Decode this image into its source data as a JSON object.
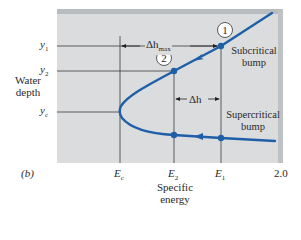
{
  "figure": {
    "panel_label": "(b)",
    "y_axis_title_line1": "Water",
    "y_axis_title_line2": "depth",
    "x_axis_title_line1": "Specific",
    "x_axis_title_line2": "energy",
    "y_ticks": [
      {
        "symbol": "y",
        "sub": "1"
      },
      {
        "symbol": "y",
        "sub": "2"
      },
      {
        "symbol": "y",
        "sub": "c"
      }
    ],
    "x_ticks": [
      {
        "symbol": "E",
        "sub": "c"
      },
      {
        "symbol": "E",
        "sub": "2"
      },
      {
        "symbol": "E",
        "sub": "1"
      }
    ],
    "x_end_value": "2.0",
    "point_labels": [
      "1",
      "2"
    ],
    "delta_h_max": {
      "symbol": "Δh",
      "sub": "max"
    },
    "delta_h": {
      "symbol": "Δh"
    },
    "annotations": {
      "subcritical_line1": "Subcritical",
      "subcritical_line2": "bump",
      "supercritical_line1": "Supercritical",
      "supercritical_line2": "bump"
    },
    "colors": {
      "curve": "#1f5fa8",
      "panel": "#dadcde",
      "panel_shadow": "#b9bcbf",
      "grid_lines": "#3a3a3a"
    }
  }
}
